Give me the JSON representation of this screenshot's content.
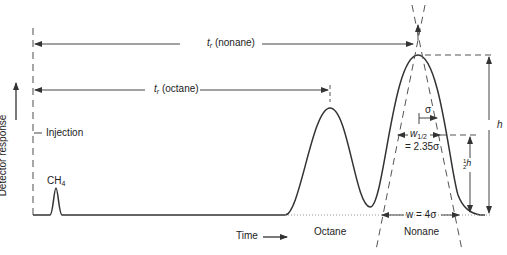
{
  "diagram": {
    "type": "gas chromatogram schematic",
    "axes": {
      "y_label": "Detector response",
      "x_label": "Time"
    },
    "markers": {
      "injection": "Injection"
    },
    "peaks": [
      {
        "name": "CH4",
        "label_main": "CH",
        "label_sub": "4"
      },
      {
        "name": "Octane",
        "label": "Octane"
      },
      {
        "name": "Nonane",
        "label": "Nonane"
      }
    ],
    "retention_times": {
      "nonane": {
        "symbol": "t",
        "sub": "r",
        "text": " (nonane)"
      },
      "octane": {
        "symbol": "t",
        "sub": "r",
        "text": " (octane)"
      }
    },
    "annotations": {
      "sigma": "σ",
      "half_width_symbol": "w",
      "half_width_sub": "1/2",
      "half_width_eq": "= 2.35σ",
      "base_width": "w = 4σ",
      "height": "h",
      "half_height_num": "1",
      "half_height_den": "2",
      "half_height_h": "h"
    },
    "colors": {
      "line": "#333333",
      "dashed": "#555555"
    }
  }
}
